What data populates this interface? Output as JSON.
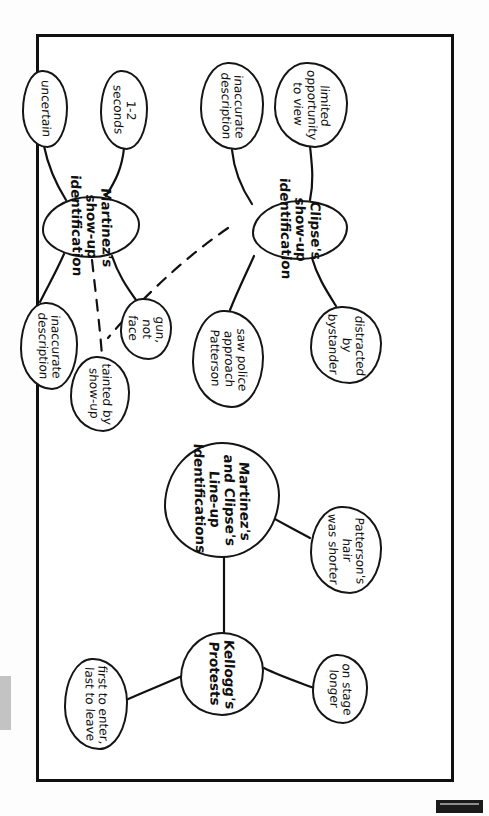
{
  "document": {
    "type": "hand-drawn mind map",
    "title_visible": false,
    "orientation": "landscape page rotated 90 degrees clockwise within a portrait scan",
    "ink_color": "#111111",
    "paper_color": "#ffffff",
    "border": "hand-drawn rectangular frame"
  },
  "nodes": {
    "clipse_center": "Clipse's show-up\nidentification",
    "clipse_limited_opportunity": "limited opportunity\nto view",
    "clipse_distracted": "distracted\nby bystander",
    "clipse_inaccurate_description": "inaccurate\ndescription",
    "clipse_saw_police": "saw police\napproach Patterson",
    "martinez_center": "Martinez's show-up\nidentification",
    "martinez_1_2_seconds": "1-2 seconds",
    "martinez_gun_not_face": "gun, not\nface",
    "martinez_uncertain": "uncertain",
    "martinez_inaccurate_description": "inaccurate\ndescription",
    "tainted_by_showup": "tainted by\nshow-up",
    "lineup_center": "Martinez's and Clipse's\nLine-up Identifications",
    "lineup_hair_shorter": "Patterson's hair\nwas shorter",
    "lineup_on_stage_longer": "on stage\nlonger",
    "kelloggs_protests": "Kellogg's Protests",
    "kelloggs_first_last": "first to enter,\nlast to leave"
  },
  "edges": [
    {
      "from": "clipse_center",
      "to": "clipse_limited_opportunity",
      "style": "solid"
    },
    {
      "from": "clipse_center",
      "to": "clipse_distracted",
      "style": "solid"
    },
    {
      "from": "clipse_center",
      "to": "clipse_inaccurate_description",
      "style": "solid"
    },
    {
      "from": "clipse_center",
      "to": "clipse_saw_police",
      "style": "solid"
    },
    {
      "from": "clipse_center",
      "to": "tainted_by_showup",
      "style": "dashed"
    },
    {
      "from": "martinez_center",
      "to": "martinez_1_2_seconds",
      "style": "solid"
    },
    {
      "from": "martinez_center",
      "to": "martinez_gun_not_face",
      "style": "solid"
    },
    {
      "from": "martinez_center",
      "to": "martinez_uncertain",
      "style": "solid"
    },
    {
      "from": "martinez_center",
      "to": "martinez_inaccurate_description",
      "style": "solid"
    },
    {
      "from": "martinez_center",
      "to": "tainted_by_showup",
      "style": "dashed"
    },
    {
      "from": "lineup_center",
      "to": "lineup_hair_shorter",
      "style": "solid"
    },
    {
      "from": "lineup_center",
      "to": "kelloggs_protests",
      "style": "solid"
    },
    {
      "from": "kelloggs_protests",
      "to": "lineup_on_stage_longer",
      "style": "solid"
    },
    {
      "from": "kelloggs_protests",
      "to": "kelloggs_first_last",
      "style": "solid"
    }
  ],
  "artifacts": {
    "left_strip": "grey scanner edge smudge",
    "bottom_right_block": "dark scanner edge block"
  }
}
